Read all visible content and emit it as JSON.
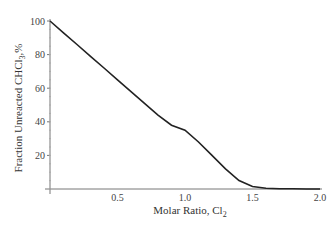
{
  "chart_data": {
    "type": "line",
    "title": "",
    "xlabel": "Molar Ratio, Cl2",
    "ylabel": "Fraction Unreacted CHCl3,%",
    "xlim": [
      0,
      2.0
    ],
    "ylim": [
      0,
      100
    ],
    "x_ticks": [
      "0.5",
      "1.0",
      "1.5",
      "2.0"
    ],
    "y_ticks": [
      "20",
      "40",
      "60",
      "80",
      "100"
    ],
    "grid": false,
    "legend": null,
    "series": [
      {
        "name": "Fraction Unreacted CHCl3",
        "x": [
          0.0,
          0.1,
          0.2,
          0.3,
          0.4,
          0.5,
          0.6,
          0.7,
          0.8,
          0.9,
          1.0,
          1.1,
          1.2,
          1.3,
          1.4,
          1.5,
          1.6,
          1.7,
          1.8,
          1.9,
          2.0
        ],
        "values": [
          100,
          93,
          86,
          79,
          72,
          65,
          58,
          51,
          44,
          38,
          35,
          28,
          20,
          12,
          5,
          1.5,
          0.5,
          0.2,
          0.1,
          0,
          0
        ]
      }
    ]
  },
  "labels": {
    "xlabel_main": "Molar Ratio, Cl",
    "xlabel_sub": "2",
    "ylabel_main": "Fraction Unreacted CHCl",
    "ylabel_sub": "3",
    "ylabel_suffix": ",%"
  }
}
